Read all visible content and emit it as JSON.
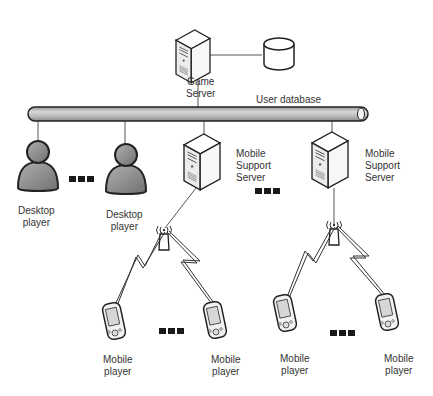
{
  "diagram": {
    "type": "network-architecture",
    "colors": {
      "line": "#555555",
      "bus_fill": "#bdbdbd",
      "person_fill": "#8c8c8c",
      "server_fill": "#f2f2f2",
      "outline": "#222222"
    },
    "nodes": {
      "game_server": {
        "icon": "server-icon",
        "label_line1": "Game",
        "label_line2": "Server"
      },
      "user_database": {
        "icon": "database-icon",
        "label": "User database"
      },
      "desktop_player_1": {
        "icon": "person-icon",
        "label_line1": "Desktop",
        "label_line2": "player"
      },
      "desktop_player_2": {
        "icon": "person-icon",
        "label_line1": "Desktop",
        "label_line2": "player"
      },
      "mobile_support_server_1": {
        "icon": "server-icon",
        "label_line1": "Mobile",
        "label_line2": "Support",
        "label_line3": "Server"
      },
      "mobile_support_server_2": {
        "icon": "server-icon",
        "label_line1": "Mobile",
        "label_line2": "Support",
        "label_line3": "Server"
      },
      "antenna_1": {
        "icon": "antenna-icon"
      },
      "antenna_2": {
        "icon": "antenna-icon"
      },
      "mobile_player_1": {
        "icon": "pda-icon",
        "label_line1": "Mobile",
        "label_line2": "player"
      },
      "mobile_player_2": {
        "icon": "pda-icon",
        "label_line1": "Mobile",
        "label_line2": "player"
      },
      "mobile_player_3": {
        "icon": "pda-icon",
        "label_line1": "Mobile",
        "label_line2": "player"
      },
      "mobile_player_4": {
        "icon": "pda-icon",
        "label_line1": "Mobile",
        "label_line2": "player"
      }
    },
    "edges": [
      [
        "game_server",
        "user_database"
      ],
      [
        "game_server",
        "network_bus"
      ],
      [
        "network_bus",
        "desktop_player_1"
      ],
      [
        "network_bus",
        "desktop_player_2"
      ],
      [
        "network_bus",
        "mobile_support_server_1"
      ],
      [
        "network_bus",
        "mobile_support_server_2"
      ],
      [
        "mobile_support_server_1",
        "antenna_1"
      ],
      [
        "mobile_support_server_2",
        "antenna_2"
      ],
      [
        "antenna_1",
        "mobile_player_1",
        "wireless"
      ],
      [
        "antenna_1",
        "mobile_player_2",
        "wireless"
      ],
      [
        "antenna_2",
        "mobile_player_3",
        "wireless"
      ],
      [
        "antenna_2",
        "mobile_player_4",
        "wireless"
      ]
    ],
    "ellipsis": "■■■"
  }
}
